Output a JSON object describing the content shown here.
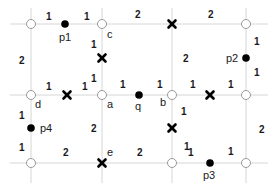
{
  "diagram": {
    "grid": {
      "verticals": [
        31,
        102,
        172,
        246
      ],
      "horizontals": [
        24,
        95,
        163
      ],
      "color": "#d6d6d6"
    },
    "nodes": [
      {
        "id": "n1",
        "x": 31,
        "y": 24,
        "label": ""
      },
      {
        "id": "c",
        "x": 102,
        "y": 24,
        "label": "c"
      },
      {
        "id": "n3",
        "x": 246,
        "y": 24,
        "label": ""
      },
      {
        "id": "d",
        "x": 31,
        "y": 95,
        "label": "d"
      },
      {
        "id": "a",
        "x": 102,
        "y": 95,
        "label": "a"
      },
      {
        "id": "b",
        "x": 172,
        "y": 95,
        "label": "b"
      },
      {
        "id": "n7",
        "x": 246,
        "y": 95,
        "label": ""
      },
      {
        "id": "n8",
        "x": 31,
        "y": 163,
        "label": ""
      },
      {
        "id": "n9",
        "x": 172,
        "y": 163,
        "label": ""
      },
      {
        "id": "n10",
        "x": 246,
        "y": 163,
        "label": ""
      }
    ],
    "points": [
      {
        "id": "p1",
        "x": 65,
        "y": 24,
        "label": "p1"
      },
      {
        "id": "p2",
        "x": 246,
        "y": 58,
        "label": "p2"
      },
      {
        "id": "q",
        "x": 139,
        "y": 95,
        "label": "q"
      },
      {
        "id": "p4",
        "x": 31,
        "y": 128,
        "label": "p4"
      },
      {
        "id": "p3",
        "x": 210,
        "y": 163,
        "label": "p3"
      }
    ],
    "crosses": [
      {
        "x": 172,
        "y": 24
      },
      {
        "x": 102,
        "y": 58
      },
      {
        "x": 67,
        "y": 95
      },
      {
        "x": 210,
        "y": 95
      },
      {
        "x": 172,
        "y": 128
      },
      {
        "x": 102,
        "y": 163,
        "label": "e"
      }
    ],
    "labels": {
      "c": "c",
      "d": "d",
      "a": "a",
      "b": "b",
      "e": "e",
      "p1": "p1",
      "p2": "p2",
      "p3": "p3",
      "p4": "p4",
      "q": "q"
    },
    "weights": [
      {
        "x": 46,
        "y": 20,
        "v": "1"
      },
      {
        "x": 84,
        "y": 20,
        "v": "1"
      },
      {
        "x": 135,
        "y": 18,
        "v": "2"
      },
      {
        "x": 208,
        "y": 18,
        "v": "2"
      },
      {
        "x": 19,
        "y": 64,
        "v": "2"
      },
      {
        "x": 91,
        "y": 48,
        "v": "1"
      },
      {
        "x": 183,
        "y": 62,
        "v": "2"
      },
      {
        "x": 254,
        "y": 45,
        "v": "1"
      },
      {
        "x": 254,
        "y": 76,
        "v": "1"
      },
      {
        "x": 46,
        "y": 90,
        "v": "1"
      },
      {
        "x": 82,
        "y": 90,
        "v": "1"
      },
      {
        "x": 91,
        "y": 82,
        "v": "1"
      },
      {
        "x": 120,
        "y": 88,
        "v": "1"
      },
      {
        "x": 157,
        "y": 88,
        "v": "1"
      },
      {
        "x": 190,
        "y": 88,
        "v": "1"
      },
      {
        "x": 228,
        "y": 88,
        "v": "1"
      },
      {
        "x": 19,
        "y": 119,
        "v": "1"
      },
      {
        "x": 19,
        "y": 151,
        "v": "1"
      },
      {
        "x": 91,
        "y": 132,
        "v": "2"
      },
      {
        "x": 181,
        "y": 115,
        "v": "1"
      },
      {
        "x": 259,
        "y": 133,
        "v": "2"
      },
      {
        "x": 63,
        "y": 156,
        "v": "2"
      },
      {
        "x": 137,
        "y": 156,
        "v": "2"
      },
      {
        "x": 184,
        "y": 150,
        "v": "1"
      },
      {
        "x": 188,
        "y": 156,
        "v": "1"
      },
      {
        "x": 228,
        "y": 155,
        "v": "1"
      }
    ]
  }
}
